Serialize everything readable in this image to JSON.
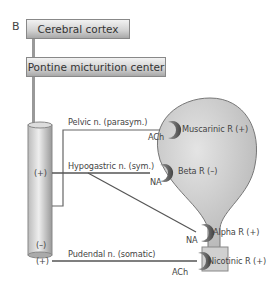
{
  "panel_label": "B",
  "boxes": {
    "cortex": "Cerebral cortex",
    "pmc": "Pontine micturition center"
  },
  "nerves": {
    "pelvic": "Pelvic n. (parasym.)",
    "hypogastric": "Hypogastric n. (sym.)",
    "pudendal": "Pudendal n. (somatic)"
  },
  "spinal_signs": {
    "hypogastric": "(+)",
    "pelvic": "(–)",
    "pudendal": "(+)"
  },
  "transmitters": {
    "muscarinic": "ACh",
    "beta": "NA",
    "alpha": "NA",
    "nicotinic": "ACh"
  },
  "receptors": {
    "muscarinic": "Muscarinic R (+)",
    "beta": "Beta R (–)",
    "alpha": "Alpha R (+)",
    "nicotinic": "Nicotinic R (+)"
  }
}
